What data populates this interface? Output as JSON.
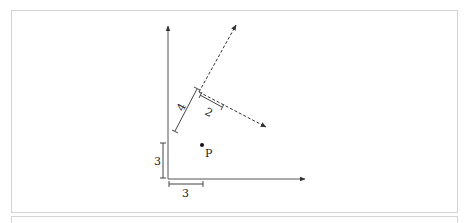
{
  "figure": {
    "labels": {
      "x_offset": "3",
      "y_offset": "3",
      "local_y_length": "4",
      "local_x_length": "2",
      "point": "P"
    },
    "colors": {
      "stroke": "#333333",
      "panel_border": "#d4d4d4"
    }
  }
}
